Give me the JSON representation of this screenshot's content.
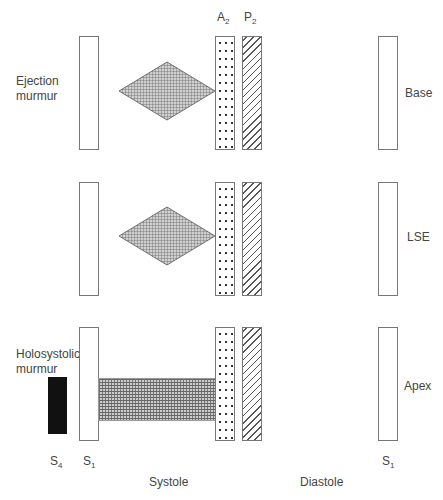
{
  "rows": [
    {
      "left_label_line1": "Ejection",
      "left_label_line2": "murmur",
      "right_label": "Base"
    },
    {
      "right_label": "LSE"
    },
    {
      "left_label_line1": "Holosystolic",
      "left_label_line2": "murmur",
      "right_label": "Apex"
    }
  ],
  "top_labels": {
    "a2": "A",
    "a2_sub": "2",
    "p2": "P",
    "p2_sub": "2"
  },
  "bottom_labels": {
    "s4": "S",
    "s4_sub": "4",
    "s1_left": "S",
    "s1_left_sub": "1",
    "s1_right": "S",
    "s1_right_sub": "1",
    "systole": "Systole",
    "diastole": "Diastole"
  }
}
